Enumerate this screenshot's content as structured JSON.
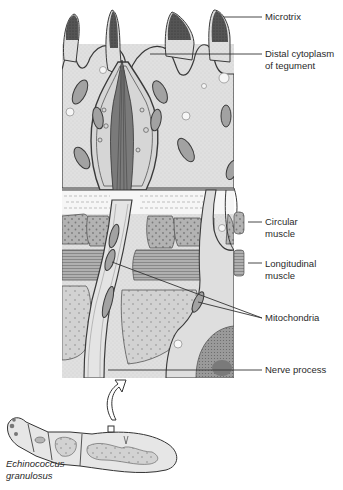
{
  "figure": {
    "colors": {
      "cytoplasm": "#dcdcdc",
      "cytoplasm_dark": "#c9c9c9",
      "microtrix_tip": "#4a4a4a",
      "muscle_circular": "#a9a9a9",
      "muscle_longitudinal": "#9a9a9a",
      "outline": "#3a3a3a",
      "basal_layer": "#f4f4f4",
      "nucleus": "#8d8d8d"
    }
  },
  "labels": {
    "microtrix": "Microtrix",
    "distal_cytoplasm_line1": "Distal cytoplasm",
    "distal_cytoplasm_line2": "of tegument",
    "circular_muscle_line1": "Circular",
    "circular_muscle_line2": "muscle",
    "longitudinal_muscle_line1": "Longitudinal",
    "longitudinal_muscle_line2": "muscle",
    "mitochondria": "Mitochondria",
    "nerve_process": "Nerve process",
    "species_line1": "Echinococcus",
    "species_line2": "granulosus"
  }
}
